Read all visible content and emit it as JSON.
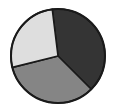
{
  "chart_data": {
    "type": "pie",
    "title": "",
    "subtitle": "",
    "xlabel": "",
    "ylabel": "",
    "grid": false,
    "legend": "none",
    "labels": [
      "Slice 1",
      "Slice 2",
      "Slice 3"
    ],
    "values": [
      39,
      34,
      27
    ],
    "units": "percent",
    "start_angle_deg": -7,
    "direction": "clockwise",
    "slice_angles_deg": [
      142,
      121,
      97
    ],
    "colors": [
      "#343434",
      "#858585",
      "#dedede"
    ],
    "edge_color": "#1a1a1a",
    "edge_width": 1.6,
    "background": "#ffffff",
    "center": {
      "x": 58,
      "y": 56
    },
    "radius": 47,
    "slices": [
      {
        "name": "Slice 1",
        "value": 39,
        "color": "#343434",
        "start_deg": -7,
        "end_deg": 135,
        "position": "top-right"
      },
      {
        "name": "Slice 2",
        "value": 34,
        "color": "#858585",
        "start_deg": 135,
        "end_deg": 256,
        "position": "bottom"
      },
      {
        "name": "Slice 3",
        "value": 27,
        "color": "#dedede",
        "start_deg": 256,
        "end_deg": 353,
        "position": "left"
      }
    ]
  }
}
